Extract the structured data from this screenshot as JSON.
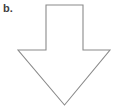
{
  "figure": {
    "label": "b.",
    "label_color": "#3f3f3f",
    "background_color": "#ffffff",
    "width": 122,
    "height": 112
  },
  "shape": {
    "name": "down-arrow",
    "kind": "block-arrow-outline",
    "direction": "down",
    "stroke_color": "#8a8a8a",
    "fill_color": "#ffffff",
    "stroke_width": 1.1,
    "points": "46,5 83,5 83,50 110,50 64.5,105 18,50 46,50",
    "vertices": [
      {
        "name": "shaft-top-left",
        "x": 46,
        "y": 5
      },
      {
        "name": "shaft-top-right",
        "x": 83,
        "y": 5
      },
      {
        "name": "shoulder-right-inner",
        "x": 83,
        "y": 50
      },
      {
        "name": "wing-tip-right",
        "x": 110,
        "y": 50
      },
      {
        "name": "arrow-point-bottom",
        "x": 64.5,
        "y": 105
      },
      {
        "name": "wing-tip-left",
        "x": 18,
        "y": 50
      },
      {
        "name": "shoulder-left-inner",
        "x": 46,
        "y": 50
      }
    ]
  }
}
